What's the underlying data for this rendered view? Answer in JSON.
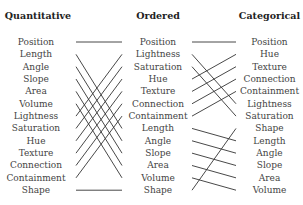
{
  "columns": [
    {
      "title": "Quantitative",
      "items": [
        "Position",
        "Length",
        "Angle",
        "Slope",
        "Area",
        "Volume",
        "Lightness",
        "Saturation",
        "Hue",
        "Texture",
        "Connection",
        "Containment",
        "Shape"
      ]
    },
    {
      "title": "Ordered",
      "items": [
        "Position",
        "Lightness",
        "Saturation",
        "Hue",
        "Texture",
        "Connection",
        "Containment",
        "Length",
        "Angle",
        "Slope",
        "Area",
        "Volume",
        "Shape"
      ]
    },
    {
      "title": "Categorical",
      "items": [
        "Position",
        "Hue",
        "Texture",
        "Connection",
        "Containment",
        "Lightness",
        "Saturation",
        "Shape",
        "Length",
        "Angle",
        "Slope",
        "Area",
        "Volume"
      ]
    }
  ],
  "line_color": "#333333"
}
